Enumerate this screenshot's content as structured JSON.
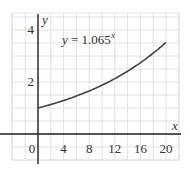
{
  "chart_data": {
    "type": "line",
    "title": "",
    "xlabel": "x",
    "ylabel": "y",
    "xlim": [
      -4,
      22
    ],
    "ylim": [
      -1,
      4.6
    ],
    "xticks": [
      0,
      4,
      8,
      12,
      16,
      20
    ],
    "yticks": [
      2,
      4
    ],
    "xtick_labels": [
      "0",
      "4",
      "8",
      "12",
      "16",
      "20"
    ],
    "ytick_labels": [
      "2",
      "4"
    ],
    "grid": true,
    "grid_x_step": 2,
    "grid_y_step": 0.5,
    "legend": null,
    "annotations": [
      {
        "text": "y = 1.065^x",
        "x": 4,
        "y": 4
      }
    ],
    "series": [
      {
        "name": "y = 1.065^x",
        "function": "1.065^x",
        "x": [
          0,
          2,
          4,
          6,
          8,
          10,
          12,
          14,
          16,
          18,
          20
        ],
        "y": [
          1.0,
          1.134,
          1.286,
          1.459,
          1.655,
          1.877,
          2.129,
          2.415,
          2.739,
          3.107,
          3.524
        ]
      }
    ]
  },
  "labels": {
    "equation_prefix": "y",
    "equation_middle": " = 1.065",
    "equation_exponent": "x",
    "x_axis": "x",
    "y_axis": "y"
  },
  "colors": {
    "grid": "#e2e2e2",
    "axis": "#222222",
    "curve": "#444444",
    "text": "#333333"
  }
}
